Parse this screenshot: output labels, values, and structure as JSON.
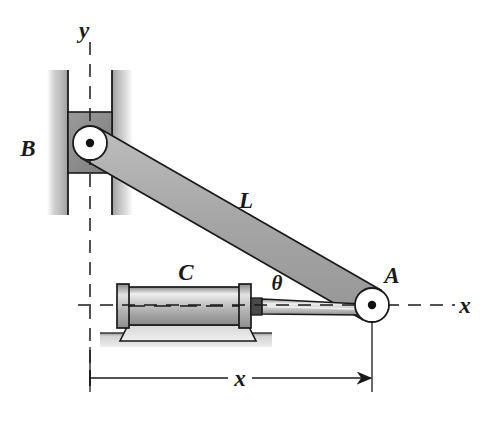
{
  "figure": {
    "background_color": "#ffffff",
    "line_color": "#1a1a1a"
  },
  "labels": {
    "axis_y": "y",
    "axis_x": "x",
    "point_b": "B",
    "point_a": "A",
    "link_l": "L",
    "cylinder_c": "C",
    "angle_theta": "θ",
    "dimension_x": "x"
  },
  "colors": {
    "link_fill": "#a8a8a8",
    "link_stroke": "#1a1a1a",
    "block_fill": "#8f8f8f",
    "rail_fill": "#c9c9c9",
    "cylinder_fill": "#b5b5b5",
    "cylinder_highlight": "#e8e8e8",
    "ground_fill": "#c0c0c0",
    "pivot_fill": "#ffffff",
    "pivot_dot": "#111111",
    "rod_fill": "#cfcfcf",
    "collar_fill": "#4a4a4a"
  },
  "geometry": {
    "pivot_b": {
      "cx": 90,
      "cy": 143,
      "r": 17
    },
    "pivot_a": {
      "cx": 372,
      "cy": 305,
      "r": 17
    },
    "axis_origin": {
      "x": 90,
      "y": 305
    },
    "dimension_line_y": 378,
    "dimension_from_x": 90,
    "dimension_to_x": 372
  },
  "elements": {
    "vertical_guide": "vertical slotted guide rails",
    "slider_block": "slider block at B",
    "link": "rigid link L from B to A",
    "hydraulic_cylinder": "hydraulic cylinder C on ground mount",
    "piston_rod": "piston rod connecting cylinder to A",
    "ground": "fixed ground support"
  }
}
